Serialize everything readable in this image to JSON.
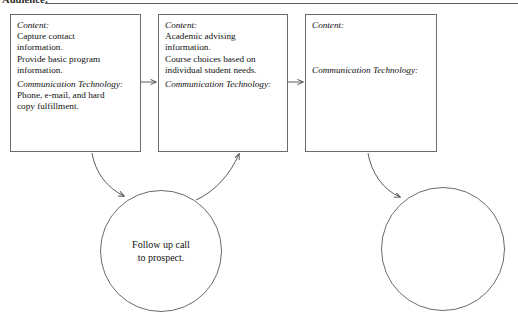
{
  "header": {
    "label": "Audience:",
    "rule": true
  },
  "labels": {
    "content": "Content:",
    "communication_technology": "Communication Technology:"
  },
  "boxes": [
    {
      "id": "box1",
      "content_label": "Content:",
      "content_text": "Capture contact information. Provide basic program information.",
      "content_lines": [
        "Capture contact",
        "information.",
        "Provide basic program",
        "information."
      ],
      "tech_label": "Communication Technology:",
      "tech_text": "Phone, e-mail, and hard copy fulfillment.",
      "tech_lines": [
        "Phone, e-mail, and hard",
        "copy fulfillment."
      ]
    },
    {
      "id": "box2",
      "content_label": "Content:",
      "content_text": "Academic advising information. Course choices based on individual student needs.",
      "content_lines": [
        "Academic advising",
        "information.",
        "Course choices based on",
        "individual student needs."
      ],
      "tech_label": "Communication Technology:",
      "tech_text": "",
      "tech_lines": []
    },
    {
      "id": "box3",
      "content_label": "Content:",
      "content_text": "",
      "content_lines": [],
      "tech_label": "Communication Technology:",
      "tech_text": "",
      "tech_lines": []
    }
  ],
  "circles": [
    {
      "id": "circle1",
      "text": "Follow up call to prospect.",
      "lines": [
        "Follow up call",
        "to prospect."
      ]
    },
    {
      "id": "circle2",
      "text": "",
      "lines": []
    }
  ],
  "connectors": [
    {
      "name": "box1-to-box2",
      "type": "straight-arrow",
      "direction": "right"
    },
    {
      "name": "box2-to-box3",
      "type": "straight-arrow",
      "direction": "right"
    },
    {
      "name": "box1-to-circle1",
      "type": "curved-arrow",
      "direction": "down-right"
    },
    {
      "name": "circle1-to-box2",
      "type": "curved-arrow",
      "direction": "up-right"
    },
    {
      "name": "box3-to-circle2",
      "type": "curved-arrow",
      "direction": "down-right"
    }
  ],
  "colors": {
    "stroke": "#6b6b6b",
    "arrow": "#4a4a4a",
    "text": "#111111",
    "background": "#ffffff"
  }
}
